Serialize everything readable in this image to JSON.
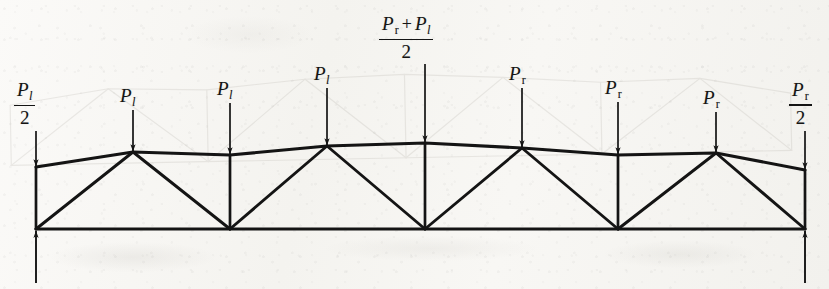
{
  "figure": {
    "kind": "roof-truss-loading-diagram",
    "width": 829,
    "height": 289,
    "ink_color": "#141414",
    "paper_color": "#f7f6f3",
    "ghost_color": "#9a958c"
  },
  "labels": {
    "left_reaction": {
      "numerator_symbol": "P",
      "numerator_subscript": "l",
      "denominator": "2"
    },
    "right_reaction": {
      "numerator_symbol": "P",
      "numerator_subscript": "r",
      "denominator": "2"
    },
    "center_load": {
      "left_symbol": "P",
      "left_subscript": "r",
      "operator": "+",
      "right_symbol": "P",
      "right_subscript": "l",
      "denominator": "2"
    },
    "left_loads": [
      {
        "symbol": "P",
        "subscript": "l"
      },
      {
        "symbol": "P",
        "subscript": "l"
      },
      {
        "symbol": "P",
        "subscript": "l"
      }
    ],
    "right_loads": [
      {
        "symbol": "P",
        "subscript": "r"
      },
      {
        "symbol": "P",
        "subscript": "r"
      },
      {
        "symbol": "P",
        "subscript": "r"
      }
    ]
  },
  "geometry": {
    "bottom_chord": {
      "y": 229,
      "x_left": 36,
      "x_right": 805
    },
    "top_chord_nodes": [
      {
        "x": 36,
        "y": 167
      },
      {
        "x": 133,
        "y": 152
      },
      {
        "x": 230,
        "y": 155
      },
      {
        "x": 327,
        "y": 146
      },
      {
        "x": 425,
        "y": 143
      },
      {
        "x": 522,
        "y": 148
      },
      {
        "x": 618,
        "y": 155
      },
      {
        "x": 716,
        "y": 153
      },
      {
        "x": 805,
        "y": 170
      }
    ],
    "bottom_chord_nodes": [
      {
        "x": 36,
        "y": 229
      },
      {
        "x": 230,
        "y": 229
      },
      {
        "x": 425,
        "y": 229
      },
      {
        "x": 618,
        "y": 229
      },
      {
        "x": 805,
        "y": 229
      }
    ],
    "web_members": [
      {
        "from": [
          36,
          229
        ],
        "to": [
          133,
          152
        ]
      },
      {
        "from": [
          133,
          152
        ],
        "to": [
          230,
          229
        ]
      },
      {
        "from": [
          230,
          229
        ],
        "to": [
          327,
          146
        ]
      },
      {
        "from": [
          327,
          146
        ],
        "to": [
          425,
          229
        ]
      },
      {
        "from": [
          425,
          229
        ],
        "to": [
          522,
          148
        ]
      },
      {
        "from": [
          522,
          148
        ],
        "to": [
          618,
          229
        ]
      },
      {
        "from": [
          618,
          229
        ],
        "to": [
          716,
          153
        ]
      },
      {
        "from": [
          716,
          153
        ],
        "to": [
          805,
          229
        ]
      }
    ],
    "vertical_members": [
      {
        "x": 36,
        "from_y": 167,
        "to_y": 229
      },
      {
        "x": 230,
        "from_y": 155,
        "to_y": 229
      },
      {
        "x": 425,
        "from_y": 143,
        "to_y": 229
      },
      {
        "x": 618,
        "from_y": 155,
        "to_y": 229
      },
      {
        "x": 805,
        "from_y": 170,
        "to_y": 229
      }
    ],
    "load_arrows": [
      {
        "x": 36,
        "from_y": 131,
        "to_y": 166,
        "label": "left_reaction"
      },
      {
        "x": 133,
        "from_y": 110,
        "to_y": 151,
        "label": "left_load_1"
      },
      {
        "x": 230,
        "from_y": 103,
        "to_y": 154,
        "label": "left_load_2"
      },
      {
        "x": 327,
        "from_y": 88,
        "to_y": 145,
        "label": "left_load_3"
      },
      {
        "x": 425,
        "from_y": 64,
        "to_y": 142,
        "label": "center_load"
      },
      {
        "x": 522,
        "from_y": 88,
        "to_y": 147,
        "label": "right_load_1"
      },
      {
        "x": 618,
        "from_y": 102,
        "to_y": 154,
        "label": "right_load_2"
      },
      {
        "x": 716,
        "from_y": 112,
        "to_y": 152,
        "label": "right_load_3"
      },
      {
        "x": 805,
        "from_y": 131,
        "to_y": 169,
        "label": "right_reaction"
      }
    ],
    "reaction_arrows": [
      {
        "x": 36,
        "from_y": 283,
        "to_y": 231
      },
      {
        "x": 805,
        "from_y": 283,
        "to_y": 231
      }
    ],
    "ghost_offset": {
      "dx": -26,
      "dy": -64
    }
  }
}
